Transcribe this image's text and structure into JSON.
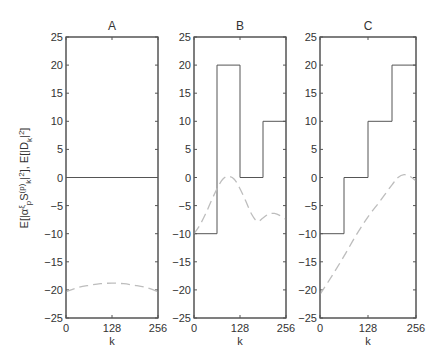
{
  "chart_data": [
    {
      "type": "line",
      "title": "A",
      "xlabel": "k",
      "ylabel": "E[|α^ξ_p S_k^(p)|²], E[|D_k|²]",
      "xlim": [
        0,
        256
      ],
      "ylim": [
        -25,
        25
      ],
      "xticks": [
        "0",
        "128",
        "256"
      ],
      "yticks": [
        "25",
        "20",
        "15",
        "10",
        "5",
        "0",
        "-5",
        "-10",
        "-15",
        "-20",
        "-25"
      ],
      "series": [
        {
          "name": "solid",
          "style": "solid",
          "x": [
            0,
            256
          ],
          "y": [
            0,
            0
          ]
        },
        {
          "name": "dashed",
          "style": "dashed",
          "x": [
            0,
            32,
            64,
            96,
            128,
            160,
            192,
            224,
            256
          ],
          "y": [
            -20.3,
            -19.6,
            -19.2,
            -18.9,
            -18.8,
            -18.9,
            -19.2,
            -19.6,
            -20.3
          ]
        }
      ]
    },
    {
      "type": "line",
      "title": "B",
      "xlabel": "k",
      "xlim": [
        0,
        256
      ],
      "ylim": [
        -25,
        25
      ],
      "xticks": [
        "0",
        "128",
        "256"
      ],
      "yticks": [
        "25",
        "20",
        "15",
        "10",
        "5",
        "0",
        "-5",
        "-10",
        "-15",
        "-20",
        "-25"
      ],
      "series": [
        {
          "name": "solid",
          "style": "step",
          "x": [
            0,
            64,
            64,
            128,
            128,
            192,
            192,
            256
          ],
          "y": [
            -10,
            -10,
            20,
            20,
            0,
            0,
            10,
            10
          ]
        },
        {
          "name": "dashed",
          "style": "dashed",
          "x": [
            0,
            16,
            32,
            48,
            64,
            80,
            96,
            112,
            128,
            144,
            160,
            176,
            192,
            208,
            224,
            240,
            256
          ],
          "y": [
            -10,
            -8.5,
            -6.5,
            -4.2,
            -2,
            -0.3,
            0.2,
            -0.3,
            -2,
            -4.2,
            -6.5,
            -7.8,
            -7.2,
            -6.5,
            -6.4,
            -6.8,
            -7.5
          ]
        }
      ]
    },
    {
      "type": "line",
      "title": "C",
      "xlabel": "k",
      "xlim": [
        0,
        256
      ],
      "ylim": [
        -25,
        25
      ],
      "xticks": [
        "0",
        "128",
        "256"
      ],
      "yticks": [
        "25",
        "20",
        "15",
        "10",
        "5",
        "0",
        "-5",
        "-10",
        "-15",
        "-20",
        "-25"
      ],
      "series": [
        {
          "name": "solid",
          "style": "step",
          "x": [
            0,
            64,
            64,
            128,
            128,
            192,
            192,
            256
          ],
          "y": [
            -10,
            -10,
            0,
            0,
            10,
            10,
            20,
            20
          ]
        },
        {
          "name": "dashed",
          "style": "dashed",
          "x": [
            0,
            32,
            64,
            96,
            128,
            160,
            192,
            208,
            224,
            240,
            256
          ],
          "y": [
            -20.8,
            -17.5,
            -14,
            -10.3,
            -7,
            -4.2,
            -1.3,
            0,
            0.5,
            0.2,
            -0.6
          ]
        }
      ]
    }
  ]
}
